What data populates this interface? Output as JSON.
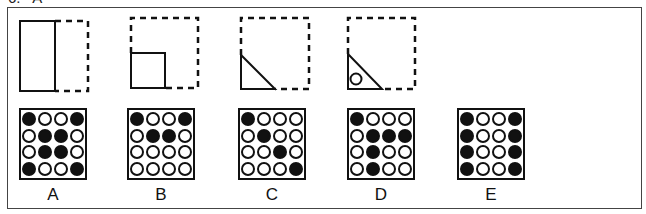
{
  "question": {
    "number_text": "6.   A"
  },
  "colors": {
    "ink": "#111111",
    "frame": "#444444",
    "background": "#ffffff"
  },
  "fold_steps": [
    {
      "id": "step-1",
      "desc": "square folded in half vertically (left solid half, right dashed)"
    },
    {
      "id": "step-2",
      "desc": "folded again to bottom-left quarter square"
    },
    {
      "id": "step-3",
      "desc": "folded diagonally into bottom-left triangle"
    },
    {
      "id": "step-4",
      "desc": "hole punched in triangle"
    }
  ],
  "options": [
    {
      "label": "A",
      "grid": [
        [
          1,
          0,
          0,
          1
        ],
        [
          0,
          1,
          1,
          0
        ],
        [
          0,
          1,
          1,
          0
        ],
        [
          1,
          0,
          0,
          1
        ]
      ]
    },
    {
      "label": "B",
      "grid": [
        [
          1,
          0,
          0,
          1
        ],
        [
          0,
          1,
          1,
          0
        ],
        [
          0,
          0,
          0,
          0
        ],
        [
          0,
          0,
          0,
          0
        ]
      ]
    },
    {
      "label": "C",
      "grid": [
        [
          1,
          0,
          0,
          0
        ],
        [
          0,
          1,
          0,
          0
        ],
        [
          0,
          0,
          1,
          0
        ],
        [
          0,
          0,
          0,
          1
        ]
      ]
    },
    {
      "label": "D",
      "grid": [
        [
          1,
          0,
          0,
          0
        ],
        [
          0,
          1,
          1,
          1
        ],
        [
          0,
          1,
          0,
          0
        ],
        [
          0,
          1,
          0,
          0
        ]
      ]
    },
    {
      "label": "E",
      "grid": [
        [
          1,
          0,
          0,
          1
        ],
        [
          1,
          0,
          0,
          1
        ],
        [
          1,
          0,
          0,
          1
        ],
        [
          1,
          0,
          0,
          1
        ]
      ]
    }
  ]
}
